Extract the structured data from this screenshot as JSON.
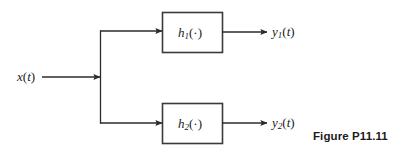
{
  "figure": {
    "caption": "Figure P11.11",
    "background_color": "#ffffff",
    "line_color": "#2b2b2b",
    "text_color": "#1b1b1b"
  },
  "diagram": {
    "type": "block-diagram",
    "input": {
      "label_html": "x(<span class=\"paren-up\"></span>t)",
      "label_base": "x",
      "label_arg": "t",
      "full_text": "x(t)"
    },
    "blocks": [
      {
        "name": "block-h1",
        "label_base": "h",
        "label_sub": "1",
        "label_arg": "·",
        "full_text": "h1(·)"
      },
      {
        "name": "block-h2",
        "label_base": "h",
        "label_sub": "2",
        "label_arg": "·",
        "full_text": "h2(·)"
      }
    ],
    "outputs": [
      {
        "name": "output-y1",
        "label_base": "y",
        "label_sub": "1",
        "label_arg": "t",
        "full_text": "y1(t)"
      },
      {
        "name": "output-y2",
        "label_base": "y",
        "label_sub": "2",
        "label_arg": "t",
        "full_text": "y2(t)"
      }
    ]
  }
}
